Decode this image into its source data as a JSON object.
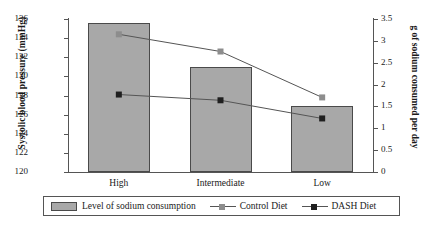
{
  "chart_data": {
    "type": "bar",
    "title": "",
    "categories": [
      "High",
      "Intermediate",
      "Low"
    ],
    "xlabel": "",
    "ylabel": "Systolic blood pressure (mmHg)",
    "y2label": "g of sodium consumed per day",
    "ylim": [
      120,
      136
    ],
    "y2lim": [
      0,
      3.5
    ],
    "yticks": [
      120,
      122,
      124,
      126,
      128,
      130,
      132,
      134,
      136
    ],
    "ytick_labels": [
      "120",
      "122",
      "124",
      "126",
      "128",
      "130",
      "132",
      "134",
      "136"
    ],
    "y2ticks": [
      0,
      0.5,
      1,
      1.5,
      2,
      2.5,
      3,
      3.5
    ],
    "y2tick_labels": [
      "0",
      "0.5",
      "1",
      "1.5",
      "2",
      "2.5",
      "3",
      "3.5"
    ],
    "grid": false,
    "legend_position": "bottom",
    "bars": {
      "name": "Level of sodium consumption",
      "axis": "right",
      "unit": "g per day",
      "values": [
        3.4,
        2.4,
        1.5
      ],
      "color": "#a8a8a8"
    },
    "series": [
      {
        "name": "Control Diet",
        "axis": "left",
        "unit": "mmHg",
        "marker": "square",
        "color": "#8d8d8d",
        "values": [
          134.4,
          132.6,
          127.8
        ]
      },
      {
        "name": "DASH Diet",
        "axis": "left",
        "unit": "mmHg",
        "marker": "square",
        "color": "#1f1f1f",
        "values": [
          128.1,
          127.5,
          125.6
        ]
      }
    ]
  },
  "legend": {
    "bar_label": "Level of sodium consumption",
    "control_label": "Control Diet",
    "dash_label": "DASH Diet"
  }
}
